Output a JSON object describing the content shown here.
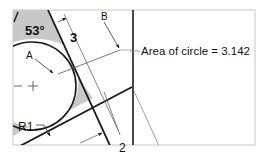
{
  "diagram": {
    "type": "cad-drawing",
    "colors": {
      "frame": "#c8c8c8",
      "line": "#1a1a1a",
      "thin": "#555555",
      "fill": "#c8c8c8"
    },
    "labels": {
      "angle": "53°",
      "dim_top": "3",
      "dim_bottom": "2",
      "leader_a": "A",
      "leader_b": "B",
      "radius": "R1",
      "area_note": "Area of circle = 3.142"
    }
  }
}
